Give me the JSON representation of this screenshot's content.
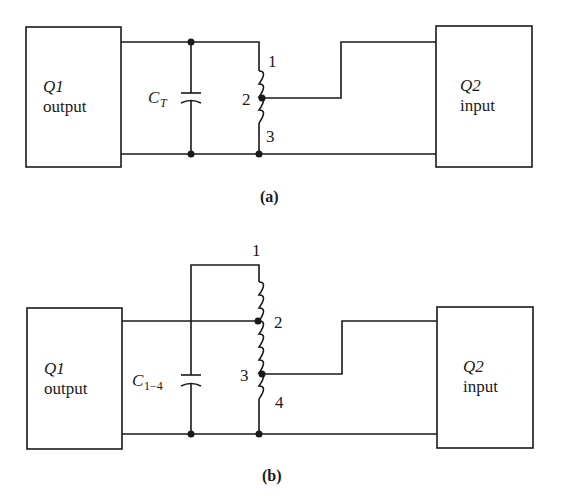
{
  "diagram": {
    "colors": {
      "ink": "#1a1a1a",
      "background": "#ffffff"
    },
    "circuit_a": {
      "caption": "(a)",
      "q1_box": {
        "name": "Q1",
        "role": "output"
      },
      "q2_box": {
        "name": "Q2",
        "role": "input"
      },
      "capacitor": {
        "symbol": "C",
        "subscript": "T"
      },
      "inductor_taps": [
        "1",
        "2",
        "3"
      ]
    },
    "circuit_b": {
      "caption": "(b)",
      "q1_box": {
        "name": "Q1",
        "role": "output"
      },
      "q2_box": {
        "name": "Q2",
        "role": "input"
      },
      "capacitor": {
        "symbol": "C",
        "subscript": "1−4"
      },
      "inductor_taps": [
        "1",
        "2",
        "3",
        "4"
      ]
    }
  }
}
